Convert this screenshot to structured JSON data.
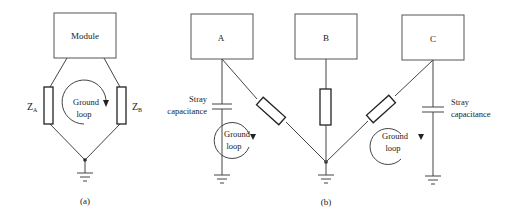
{
  "diagram": {
    "panel_a": {
      "caption": "(a)",
      "module_label": "Module",
      "impedance_a": {
        "main": "Z",
        "sub": "A"
      },
      "impedance_b": {
        "main": "Z",
        "sub": "B"
      },
      "loop_label_line1": "Ground",
      "loop_label_line2": "loop"
    },
    "panel_b": {
      "caption": "(b)",
      "module_a_label": "A",
      "module_b_label": "B",
      "module_c_label": "C",
      "stray_left_line1": "Stray",
      "stray_left_line2": "capacitance",
      "stray_right_line1": "Stray",
      "stray_right_line2": "capacitance",
      "loop_left_line1": "Ground",
      "loop_left_line2": "loop",
      "loop_right_line1": "Ground",
      "loop_right_line2": "loop"
    }
  }
}
